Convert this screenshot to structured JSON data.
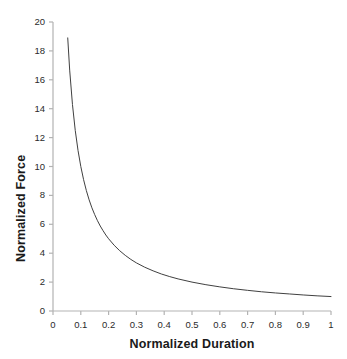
{
  "chart_data": {
    "type": "line",
    "title": "",
    "subtitle": "",
    "xlabel": "Normalized Duration",
    "ylabel": "Normalized Force",
    "xlim": [
      0,
      1
    ],
    "ylim": [
      0,
      20
    ],
    "grid": false,
    "legend": null,
    "legend_position": "none",
    "equation": "y = 1 / x",
    "xticks": [
      0,
      0.1,
      0.2,
      0.3,
      0.4,
      0.5,
      0.6,
      0.7,
      0.8,
      0.9,
      1
    ],
    "xtick_labels": [
      "0",
      "0.1",
      "0.2",
      "0.3",
      "0.4",
      "0.5",
      "0.6",
      "0.7",
      "0.8",
      "0.9",
      "1"
    ],
    "yticks": [
      0,
      2,
      4,
      6,
      8,
      10,
      12,
      14,
      16,
      18,
      20
    ],
    "ytick_labels": [
      "0",
      "2",
      "4",
      "6",
      "8",
      "10",
      "12",
      "14",
      "16",
      "18",
      "20"
    ],
    "series": [
      {
        "name": "Normalized Force",
        "color": "#404040",
        "line_width": 1,
        "x": [
          0.053,
          0.06,
          0.07,
          0.08,
          0.09,
          0.1,
          0.11,
          0.12,
          0.13,
          0.14,
          0.15,
          0.16,
          0.17,
          0.18,
          0.19,
          0.2,
          0.22,
          0.24,
          0.26,
          0.28,
          0.3,
          0.33,
          0.36,
          0.39,
          0.42,
          0.45,
          0.5,
          0.55,
          0.6,
          0.65,
          0.7,
          0.75,
          0.8,
          0.85,
          0.9,
          0.95,
          1.0
        ],
        "y": [
          18.9,
          16.67,
          14.29,
          12.5,
          11.11,
          10.0,
          9.09,
          8.33,
          7.69,
          7.14,
          6.67,
          6.25,
          5.88,
          5.56,
          5.26,
          5.0,
          4.55,
          4.17,
          3.85,
          3.57,
          3.33,
          3.03,
          2.78,
          2.56,
          2.38,
          2.22,
          2.0,
          1.82,
          1.67,
          1.54,
          1.43,
          1.33,
          1.25,
          1.18,
          1.11,
          1.05,
          1.0
        ]
      }
    ],
    "axis_color": "#b3b3b3",
    "tick_label_color": "#2b2b2b",
    "background_color": "#ffffff",
    "plot_area": {
      "left": 53,
      "right": 331,
      "top": 22,
      "bottom": 311
    }
  }
}
